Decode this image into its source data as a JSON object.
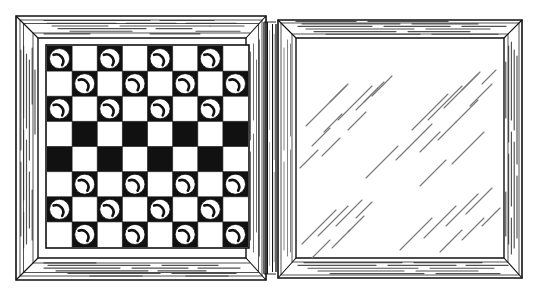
{
  "illustration": {
    "title": "Open folding checkers board",
    "subject": "checkerboard",
    "style": "black-and-white line art engraving",
    "background_color": "#ffffff",
    "ink_color": "#1a1a1a",
    "hatch_color": "#6e6e6e"
  },
  "panels": [
    {
      "id": "left-panel",
      "name": "board-panel",
      "label": "Playing surface with checkers",
      "x": 14,
      "y": 14,
      "width": 254,
      "height": 268,
      "frame_width": 20,
      "has_board": true,
      "has_hatching": true
    },
    {
      "id": "right-panel",
      "name": "empty-panel",
      "label": "Empty folding half",
      "x": 276,
      "y": 14,
      "width": 250,
      "height": 268,
      "frame_width": 20,
      "has_board": false,
      "has_hatching": true
    }
  ],
  "hinge": {
    "name": "hinge-spine",
    "label": "Hinge spine",
    "x": 262,
    "y": 20,
    "width": 18,
    "height": 256
  },
  "board": {
    "rows": 8,
    "columns": 8,
    "x": 47,
    "y": 46,
    "size": 201,
    "cell_size": 25.125,
    "light_square_color": "#ffffff",
    "dark_square_color": "#111111",
    "border_color": "#111111",
    "piece_color": "#ffffff",
    "piece_outline_color": "#111111",
    "piece_highlight_color": "#111111",
    "piece_radius_ratio": 0.4,
    "top_left_square": "dark",
    "piece_count": 24,
    "occupancy": [
      [
        1,
        0,
        1,
        0,
        1,
        0,
        1,
        0
      ],
      [
        0,
        1,
        0,
        1,
        0,
        1,
        0,
        1
      ],
      [
        1,
        0,
        1,
        0,
        1,
        0,
        1,
        0
      ],
      [
        0,
        0,
        0,
        0,
        0,
        0,
        0,
        0
      ],
      [
        0,
        0,
        0,
        0,
        0,
        0,
        0,
        0
      ],
      [
        0,
        1,
        0,
        1,
        0,
        1,
        0,
        1
      ],
      [
        1,
        0,
        1,
        0,
        1,
        0,
        1,
        0
      ],
      [
        0,
        1,
        0,
        1,
        0,
        1,
        0,
        1
      ]
    ]
  },
  "hatch_groups": {
    "right_panel_surface": {
      "name": "diagonal-hatch-marks",
      "label": "Diagonal gloss hatch strokes",
      "angle_degrees": -45,
      "stroke_color": "#777777",
      "stroke_width": 1.1,
      "count": 34
    },
    "frame_grain": {
      "name": "frame-wood-grain",
      "label": "Frame wood-grain strokes",
      "stroke_color": "#3a3a3a",
      "stroke_width": 1
    }
  },
  "legend": {
    "left_caption": "",
    "right_caption": "",
    "credit": ""
  }
}
